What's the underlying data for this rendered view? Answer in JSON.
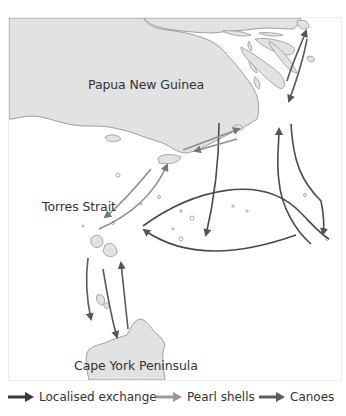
{
  "map": {
    "labels": {
      "png": "Papua New Guinea",
      "torres": "Torres Strait",
      "cape_york": "Cape York Peninsula"
    },
    "colors": {
      "land": "#e2e2e2",
      "coast": "#8a8a8a",
      "localised_exchange": "#4a4a4a",
      "pearl_shells": "#8e8e8e",
      "canoes": "#5a5a5a"
    }
  },
  "legend": {
    "items": [
      {
        "label": "Localised exchange",
        "color": "#3a3a3a"
      },
      {
        "label": "Pearl shells",
        "color": "#9a9a9a"
      },
      {
        "label": "Canoes",
        "color": "#5c5c5c"
      }
    ]
  }
}
